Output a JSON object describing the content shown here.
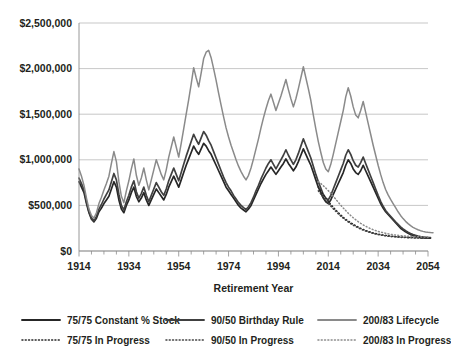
{
  "chart_data": {
    "type": "line",
    "title": "",
    "xlabel": "Retirement Year",
    "ylabel": "",
    "xlim": [
      1914,
      2054
    ],
    "ylim": [
      0,
      2500000
    ],
    "grid": true,
    "legend_position": "bottom",
    "xticks": [
      "1914",
      "1934",
      "1954",
      "1974",
      "1994",
      "2014",
      "2034",
      "2054"
    ],
    "xtick_values": [
      1914,
      1934,
      1954,
      1974,
      1994,
      2014,
      2034,
      2054
    ],
    "xtick_minor_step": 5,
    "yticks": [
      "$0",
      "$500,000",
      "$1,000,000",
      "$1,500,000",
      "$2,000,000",
      "$2,500,000"
    ],
    "ytick_values": [
      0,
      500000,
      1000000,
      1500000,
      2000000,
      2500000
    ],
    "x_start": 1914,
    "x_step": 1,
    "series": [
      {
        "name": "75/75 Constant % Stock",
        "style": "solid",
        "color": "#262626",
        "width": 1.7,
        "values": [
          760000,
          700000,
          640000,
          520000,
          420000,
          350000,
          320000,
          360000,
          430000,
          470000,
          520000,
          560000,
          600000,
          680000,
          760000,
          700000,
          560000,
          460000,
          420000,
          500000,
          560000,
          640000,
          700000,
          600000,
          540000,
          580000,
          640000,
          560000,
          500000,
          560000,
          620000,
          680000,
          640000,
          600000,
          560000,
          620000,
          700000,
          760000,
          820000,
          760000,
          700000,
          780000,
          860000,
          940000,
          1010000,
          1080000,
          1150000,
          1100000,
          1060000,
          1120000,
          1180000,
          1150000,
          1100000,
          1060000,
          1000000,
          940000,
          880000,
          820000,
          760000,
          700000,
          660000,
          620000,
          580000,
          540000,
          500000,
          470000,
          450000,
          430000,
          460000,
          500000,
          560000,
          620000,
          680000,
          740000,
          790000,
          840000,
          880000,
          920000,
          880000,
          840000,
          880000,
          920000,
          960000,
          1010000,
          960000,
          920000,
          880000,
          920000,
          980000,
          1050000,
          1120000,
          1060000,
          1000000,
          940000,
          860000,
          780000,
          700000,
          640000,
          580000,
          540000,
          520000,
          560000,
          620000,
          680000,
          740000,
          800000,
          860000,
          940000,
          1000000,
          960000,
          900000,
          860000,
          840000,
          880000,
          940000,
          880000,
          820000,
          760000,
          700000,
          640000,
          580000,
          520000,
          470000,
          430000,
          400000,
          370000,
          340000,
          310000,
          280000,
          250000,
          230000,
          210000,
          195000,
          180000,
          170000,
          160000,
          155000,
          150000,
          146000,
          143000,
          141000,
          140000
        ]
      },
      {
        "name": "90/50 Birthday Rule",
        "style": "solid",
        "color": "#404040",
        "width": 1.7,
        "values": [
          800000,
          740000,
          670000,
          540000,
          430000,
          360000,
          330000,
          380000,
          460000,
          510000,
          570000,
          620000,
          670000,
          760000,
          850000,
          780000,
          620000,
          500000,
          450000,
          540000,
          610000,
          700000,
          770000,
          650000,
          580000,
          630000,
          700000,
          610000,
          540000,
          610000,
          680000,
          750000,
          700000,
          650000,
          610000,
          680000,
          770000,
          840000,
          910000,
          840000,
          770000,
          860000,
          950000,
          1040000,
          1120000,
          1200000,
          1280000,
          1220000,
          1170000,
          1240000,
          1310000,
          1270000,
          1210000,
          1160000,
          1090000,
          1020000,
          950000,
          880000,
          810000,
          750000,
          700000,
          660000,
          610000,
          570000,
          530000,
          500000,
          475000,
          455000,
          485000,
          530000,
          590000,
          660000,
          720000,
          790000,
          850000,
          910000,
          960000,
          1000000,
          950000,
          900000,
          950000,
          1000000,
          1050000,
          1110000,
          1050000,
          1000000,
          950000,
          1000000,
          1070000,
          1150000,
          1230000,
          1160000,
          1090000,
          1020000,
          930000,
          840000,
          760000,
          690000,
          620000,
          580000,
          560000,
          610000,
          680000,
          750000,
          820000,
          890000,
          960000,
          1050000,
          1110000,
          1060000,
          990000,
          940000,
          920000,
          970000,
          1030000,
          960000,
          890000,
          820000,
          750000,
          680000,
          610000,
          545000,
          490000,
          445000,
          410000,
          380000,
          350000,
          320000,
          292000,
          265000,
          242000,
          222000,
          206000,
          192000,
          180000,
          171000,
          164000,
          158000,
          154000,
          151000,
          149000,
          148000
        ]
      },
      {
        "name": "200/83 Lifecycle",
        "style": "solid",
        "color": "#8a8a8a",
        "width": 1.5,
        "values": [
          900000,
          820000,
          720000,
          580000,
          460000,
          390000,
          360000,
          420000,
          520000,
          590000,
          670000,
          740000,
          820000,
          960000,
          1090000,
          980000,
          760000,
          600000,
          530000,
          660000,
          770000,
          900000,
          1010000,
          830000,
          720000,
          800000,
          910000,
          780000,
          670000,
          780000,
          890000,
          1000000,
          920000,
          840000,
          780000,
          890000,
          1030000,
          1140000,
          1250000,
          1140000,
          1030000,
          1180000,
          1340000,
          1500000,
          1660000,
          1830000,
          2010000,
          1900000,
          1800000,
          1950000,
          2110000,
          2180000,
          2200000,
          2120000,
          2000000,
          1870000,
          1730000,
          1600000,
          1470000,
          1350000,
          1250000,
          1160000,
          1080000,
          1000000,
          930000,
          870000,
          820000,
          780000,
          830000,
          910000,
          1010000,
          1120000,
          1230000,
          1350000,
          1460000,
          1560000,
          1650000,
          1720000,
          1630000,
          1540000,
          1620000,
          1700000,
          1790000,
          1880000,
          1770000,
          1670000,
          1580000,
          1670000,
          1780000,
          1900000,
          2020000,
          1900000,
          1780000,
          1650000,
          1490000,
          1340000,
          1200000,
          1080000,
          970000,
          900000,
          870000,
          950000,
          1060000,
          1180000,
          1300000,
          1420000,
          1540000,
          1690000,
          1790000,
          1700000,
          1580000,
          1490000,
          1460000,
          1540000,
          1640000,
          1520000,
          1400000,
          1280000,
          1160000,
          1050000,
          940000,
          840000,
          750000,
          675000,
          615000,
          565000,
          520000,
          475000,
          430000,
          390000,
          355000,
          325000,
          300000,
          278000,
          260000,
          245000,
          233000,
          223000,
          215000,
          209000,
          205000,
          202000,
          200000
        ]
      }
    ],
    "projected_series": [
      {
        "name": "75/75 In Progress",
        "style": "dotted",
        "color": "#262626",
        "width": 1.5,
        "x_start": 2010,
        "values": [
          700000,
          660000,
          620000,
          580000,
          545000,
          510000,
          480000,
          450000,
          420000,
          395000,
          370000,
          348000,
          328000,
          310000,
          293000,
          277000,
          262000,
          248000,
          236000,
          225000,
          215000,
          206000,
          198000,
          191000,
          185000,
          180000,
          175000,
          171000,
          167000,
          164000,
          161000,
          158000,
          156000,
          154000,
          152000,
          150000,
          149000,
          148000,
          147000,
          146000,
          145000,
          144000,
          143000,
          142000,
          142000
        ]
      },
      {
        "name": "90/50 In Progress",
        "style": "dotted",
        "color": "#404040",
        "width": 1.5,
        "x_start": 2010,
        "values": [
          660000,
          625000,
          590000,
          556000,
          524000,
          493000,
          463000,
          435000,
          408000,
          383000,
          360000,
          338000,
          318000,
          300000,
          283000,
          268000,
          254000,
          241000,
          229000,
          219000,
          209000,
          201000,
          193000,
          186000,
          180000,
          175000,
          170000,
          166000,
          162000,
          159000,
          156000,
          154000,
          152000,
          150000,
          148000,
          147000,
          146000,
          145000,
          144000,
          143000,
          142000,
          141000,
          140000,
          140000,
          139000
        ]
      },
      {
        "name": "200/83 In Progress",
        "style": "dotted",
        "color": "#8a8a8a",
        "width": 1.5,
        "x_start": 2010,
        "values": [
          760000,
          740000,
          716000,
          690000,
          662000,
          632000,
          600000,
          568000,
          535000,
          503000,
          472000,
          443000,
          415000,
          389000,
          365000,
          343000,
          322000,
          303000,
          286000,
          271000,
          257000,
          245000,
          234000,
          224000,
          215000,
          207000,
          200000,
          194000,
          188000,
          183000,
          179000,
          175000,
          172000,
          169000,
          166000,
          164000,
          162000,
          160000,
          158000,
          157000,
          156000,
          155000,
          154000,
          153000,
          152000
        ]
      }
    ]
  },
  "legend": {
    "items": [
      {
        "label": "75/75 Constant % Stock",
        "style": "solid",
        "color": "#262626"
      },
      {
        "label": "90/50 Birthday Rule",
        "style": "solid",
        "color": "#404040"
      },
      {
        "label": "200/83 Lifecycle",
        "style": "solid",
        "color": "#8a8a8a"
      },
      {
        "label": "75/75 In Progress",
        "style": "dotted",
        "color": "#262626"
      },
      {
        "label": "90/50 In Progress",
        "style": "dotted",
        "color": "#404040"
      },
      {
        "label": "200/83 In Progress",
        "style": "dotted",
        "color": "#8a8a8a"
      }
    ]
  }
}
